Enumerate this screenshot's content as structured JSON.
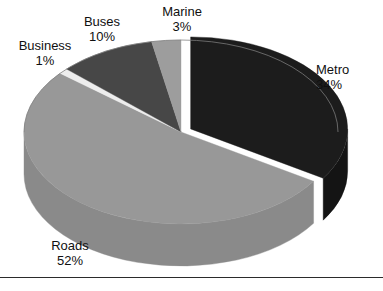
{
  "chart_data": {
    "type": "pie",
    "title": "",
    "subtitle": "",
    "xlabel": "",
    "ylabel": "",
    "legend_position": "none",
    "grid": false,
    "style": "3d-exploded-pie",
    "labels": [
      "Metro",
      "Roads",
      "Business",
      "Buses",
      "Marine"
    ],
    "values": [
      34,
      52,
      1,
      10,
      3
    ],
    "unit": "%",
    "categories": [
      "Metro",
      "Roads",
      "Business",
      "Buses",
      "Marine"
    ],
    "slices": [
      {
        "label": "Metro",
        "value": 34,
        "display": "34%",
        "color": "#1c1c1c",
        "side_color": "#141414",
        "exploded": true
      },
      {
        "label": "Roads",
        "value": 52,
        "display": "52%",
        "color": "#989898",
        "side_color": "#8a8a8a",
        "exploded": false
      },
      {
        "label": "Business",
        "value": 1,
        "display": "1%",
        "color": "#ededed",
        "side_color": "#d8d8d8",
        "exploded": false
      },
      {
        "label": "Buses",
        "value": 10,
        "display": "10%",
        "color": "#474747",
        "side_color": "#3a3a3a",
        "exploded": false
      },
      {
        "label": "Marine",
        "value": 3,
        "display": "3%",
        "color": "#9d9d9d",
        "side_color": "#8f8f8f",
        "exploded": false
      }
    ]
  },
  "labels": {
    "business": {
      "name": "Business",
      "percent": "1%"
    },
    "buses": {
      "name": "Buses",
      "percent": "10%"
    },
    "marine": {
      "name": "Marine",
      "percent": "3%"
    },
    "metro": {
      "name": "Metro",
      "percent": "34%"
    },
    "roads": {
      "name": "Roads",
      "percent": "52%"
    }
  },
  "colors": {
    "background": "#ffffff",
    "text": "#101010",
    "rule": "#2b2b2b"
  }
}
